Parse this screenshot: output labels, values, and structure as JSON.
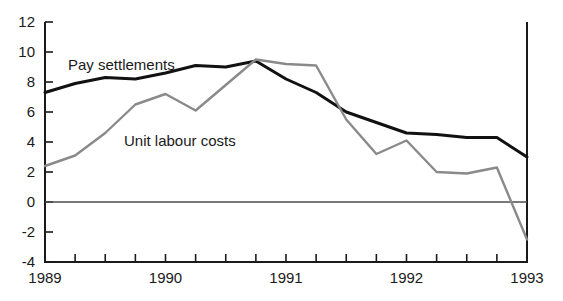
{
  "chart_data": {
    "type": "line",
    "title": "",
    "subtitle": "",
    "xlabel": "",
    "ylabel": "",
    "ylim": [
      -4,
      12
    ],
    "yticks": [
      12,
      10,
      8,
      6,
      4,
      2,
      0,
      -2,
      -4
    ],
    "ytick_labels": [
      "12",
      "10",
      "8",
      "6",
      "4",
      "2",
      "0",
      "-2",
      "-4"
    ],
    "xlim": [
      "1989 Q1",
      "1993 Q1"
    ],
    "xtick_labels": [
      "1989",
      "1990",
      "1991",
      "1992",
      "1993"
    ],
    "xtick_positions": [
      0,
      4,
      8,
      12,
      16
    ],
    "minor_xticks": 17,
    "x": [
      "1989 Q1",
      "1989 Q2",
      "1989 Q3",
      "1989 Q4",
      "1990 Q1",
      "1990 Q2",
      "1990 Q3",
      "1990 Q4",
      "1991 Q1",
      "1991 Q2",
      "1991 Q3",
      "1991 Q4",
      "1992 Q1",
      "1992 Q2",
      "1992 Q3",
      "1992 Q4",
      "1993 Q1"
    ],
    "grid": false,
    "zero_line": true,
    "legend_position": "inline-annotation",
    "series": [
      {
        "name": "Pay settlements",
        "color": "#111111",
        "width": 3.0,
        "label_x": "1989 Q2",
        "label_y": 10.4,
        "values": [
          7.3,
          7.9,
          8.3,
          8.2,
          8.6,
          9.1,
          9.0,
          9.4,
          8.2,
          7.3,
          6.0,
          5.3,
          4.6,
          4.5,
          4.3,
          4.3,
          3.0
        ]
      },
      {
        "name": "Unit labour costs",
        "color": "#8a8a8a",
        "width": 2.4,
        "label_x": "1990 Q1",
        "label_y": 5.0,
        "values": [
          2.4,
          3.1,
          4.6,
          6.5,
          7.2,
          6.1,
          7.8,
          9.5,
          9.2,
          9.1,
          5.5,
          3.2,
          4.1,
          2.0,
          1.9,
          2.3,
          -2.5
        ]
      }
    ],
    "annotations": [
      {
        "text": "Pay settlements",
        "x": 68,
        "y": 70
      },
      {
        "text": "Unit labour costs",
        "x": 124,
        "y": 146
      }
    ]
  },
  "plot_geometry": {
    "left": 45,
    "right": 527,
    "top": 22,
    "bottom": 262,
    "tick_length": 8,
    "y_label_offset": 10,
    "x_label_offset": 21
  },
  "colors": {
    "background": "#ffffff",
    "axis": "#1a1a1a",
    "zero_line": "#4d4d4d",
    "pay_settlements": "#111111",
    "unit_labour_costs": "#8a8a8a",
    "text": "#1a1a1a"
  }
}
